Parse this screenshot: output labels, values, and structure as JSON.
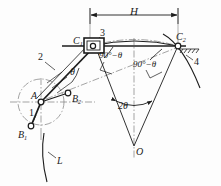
{
  "figure": {
    "type": "kinematic-mechanism-diagram",
    "stroke_color": "#1c1c1c",
    "centerline_color": "#6f6f6f",
    "background": "#ffffff"
  },
  "dimension": {
    "stroke_label": "H",
    "x_left": 90,
    "x_right": 178,
    "y": 15
  },
  "points": [
    {
      "id": "A",
      "label": "A",
      "x": 41,
      "y": 102,
      "role": "crank-pivot"
    },
    {
      "id": "B1",
      "label": "B",
      "sub": "1",
      "x": 31,
      "y": 126,
      "role": "crank-pin-position-1"
    },
    {
      "id": "B2",
      "label": "B",
      "sub": "2",
      "x": 68,
      "y": 93,
      "role": "crank-pin-position-2"
    },
    {
      "id": "C1",
      "label": "C",
      "sub": "1",
      "x": 92,
      "y": 46,
      "role": "slider-position-1"
    },
    {
      "id": "C2",
      "label": "C",
      "sub": "2",
      "x": 178,
      "y": 46,
      "role": "slider-position-2"
    },
    {
      "id": "O",
      "label": "O",
      "x": 134,
      "y": 146,
      "role": "swing-center"
    }
  ],
  "links": [
    {
      "id": "1",
      "label": "1",
      "x": 34,
      "y": 113,
      "desc": "crank"
    },
    {
      "id": "2",
      "label": "2",
      "x": 40,
      "y": 57,
      "desc": "connecting-rod"
    },
    {
      "id": "3",
      "label": "3",
      "x": 102,
      "y": 33,
      "desc": "slider-block"
    },
    {
      "id": "4",
      "label": "4",
      "x": 196,
      "y": 63,
      "desc": "rocker-arc"
    }
  ],
  "angles": [
    {
      "id": "theta",
      "label": "θ",
      "x": 73,
      "y": 73
    },
    {
      "id": "two-theta",
      "label": "2θ",
      "x": 125,
      "y": 107
    },
    {
      "id": "ninety-1",
      "label": "90°−θ",
      "x": 107,
      "y": 58
    },
    {
      "id": "ninety-2",
      "label": "90°−θ",
      "x": 140,
      "y": 66
    }
  ],
  "curves": [
    {
      "id": "L",
      "label": "L",
      "x": 59,
      "y": 163,
      "desc": "coupler-curve"
    }
  ]
}
